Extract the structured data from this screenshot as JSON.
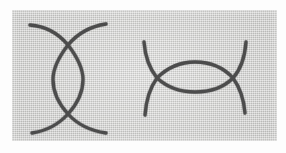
{
  "figure": {
    "title": "Two bigon curve configurations",
    "background_color": "#cdcdcb",
    "ink_color": "#4c4c4c",
    "page_color": "#fdfdfd",
    "panel": {
      "x": 12,
      "y": 10,
      "width": 265,
      "height": 131
    }
  },
  "chart_data": {
    "type": "diagram",
    "title": "Two bigon curve configurations",
    "grid": false,
    "legend": false,
    "figures": [
      {
        "name": "vertical-bigon",
        "label": "left figure",
        "orientation": "vertical",
        "crossings": [
          {
            "name": "top-crossing",
            "x": 68,
            "y": 45
          },
          {
            "name": "bottom-crossing",
            "x": 68,
            "y": 114
          }
        ],
        "lens": {
          "center_x": 68,
          "center_y": 79,
          "width": 30,
          "height": 69
        },
        "tails": [
          {
            "name": "upper-left-tail",
            "end_x": 30,
            "end_y": 25
          },
          {
            "name": "upper-right-tail",
            "end_x": 106,
            "end_y": 24
          },
          {
            "name": "lower-left-tail",
            "end_x": 32,
            "end_y": 133
          },
          {
            "name": "lower-right-tail",
            "end_x": 106,
            "end_y": 133
          }
        ]
      },
      {
        "name": "horizontal-bigon",
        "label": "right figure",
        "orientation": "horizontal",
        "crossings": [
          {
            "name": "left-crossing",
            "x": 157,
            "y": 78
          },
          {
            "name": "right-crossing",
            "x": 233,
            "y": 78
          }
        ],
        "lens": {
          "center_x": 195,
          "center_y": 77,
          "width": 76,
          "height": 30
        },
        "tails": [
          {
            "name": "upper-left-tail",
            "end_x": 144,
            "end_y": 42
          },
          {
            "name": "lower-left-tail",
            "end_x": 145,
            "end_y": 115
          },
          {
            "name": "upper-right-tail",
            "end_x": 246,
            "end_y": 42
          },
          {
            "name": "lower-right-tail",
            "end_x": 245,
            "end_y": 113
          }
        ]
      }
    ]
  }
}
